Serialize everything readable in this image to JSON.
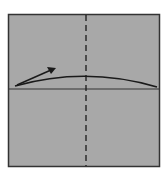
{
  "diagram": {
    "type": "origami-fold-step",
    "paper_color": "#a8a8a8",
    "edge_color": "#333333",
    "line_color": "#1a1a1a",
    "elements": [
      {
        "name": "paper-square",
        "x": 8,
        "y": 14,
        "w": 151,
        "h": 152
      },
      {
        "name": "valley-fold-line",
        "orientation": "vertical",
        "style": "dashed",
        "x": 86
      },
      {
        "name": "crease-line",
        "orientation": "horizontal",
        "style": "solid",
        "y": 89
      },
      {
        "name": "fold-curve",
        "from": [
          15,
          86
        ],
        "peak": [
          86,
          76
        ],
        "to": [
          157,
          87
        ]
      },
      {
        "name": "fold-direction-arrow",
        "from": [
          17,
          85
        ],
        "to": [
          55,
          68
        ]
      }
    ]
  }
}
